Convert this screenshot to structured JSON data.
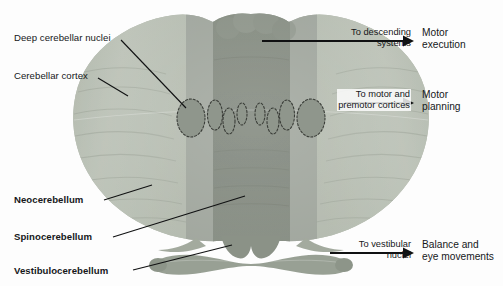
{
  "figure": {
    "background_color": "#fdfdfd",
    "width": 503,
    "height": 286
  },
  "palette": {
    "cortex_light": "#b9bfb4",
    "cortex_mid": "#a9b0a4",
    "cortex_shadow": "#949b90",
    "band_intermediate": "#9aa096",
    "band_vermis": "#7f867c",
    "nuclei_fill": "#8f968c",
    "nuclei_outline": "#3a3d38",
    "line_color": "#101112",
    "text_color": "#16181a"
  },
  "structure_labels": [
    {
      "id": "deep-cerebellar-nuclei",
      "text": "Deep cerebellar nuclei",
      "bold": false,
      "text_x": 14,
      "text_y": 32,
      "leader": {
        "x1": 121,
        "y1": 40,
        "x2": 186,
        "y2": 108
      }
    },
    {
      "id": "cerebellar-cortex",
      "text": "Cerebellar cortex",
      "bold": false,
      "text_x": 14,
      "text_y": 70,
      "leader": {
        "x1": 98,
        "y1": 78,
        "x2": 128,
        "y2": 96
      }
    },
    {
      "id": "neocerebellum",
      "text": "Neocerebellum",
      "bold": true,
      "text_x": 14,
      "text_y": 194,
      "leader": {
        "x1": 104,
        "y1": 200,
        "x2": 152,
        "y2": 185
      }
    },
    {
      "id": "spinocerebellum",
      "text": "Spinocerebellum",
      "bold": true,
      "text_x": 14,
      "text_y": 231,
      "leader": {
        "x1": 113,
        "y1": 237,
        "x2": 245,
        "y2": 196
      }
    },
    {
      "id": "vestibulocerebellum",
      "text": "Vestibulocerebellum",
      "bold": true,
      "text_x": 14,
      "text_y": 265,
      "leader": {
        "x1": 133,
        "y1": 270,
        "x2": 232,
        "y2": 245
      }
    }
  ],
  "projections": [
    {
      "id": "motor-execution",
      "target_text_line1": "To descending",
      "target_text_line2": "systems",
      "target_x_right": 411,
      "target_y": 27,
      "arrow": {
        "x1": 262,
        "y1": 41,
        "x2": 414,
        "y2": 41
      },
      "boxed": false,
      "function_line1": "Motor",
      "function_line2": "execution",
      "function_x": 422,
      "function_y": 27
    },
    {
      "id": "motor-planning",
      "target_text_line1": "To motor and",
      "target_text_line2": "premotor cortices",
      "target_x_right": 411,
      "target_y": 89,
      "arrow": {
        "x1": 345,
        "y1": 103,
        "x2": 414,
        "y2": 103
      },
      "boxed": true,
      "function_line1": "Motor",
      "function_line2": "planning",
      "function_x": 422,
      "function_y": 89
    },
    {
      "id": "balance-eye-movements",
      "target_text_line1": "To vestibular",
      "target_text_line2": "nuclei",
      "target_x_right": 411,
      "target_y": 239,
      "arrow": {
        "x1": 330,
        "y1": 253,
        "x2": 414,
        "y2": 253
      },
      "boxed": false,
      "function_line1": "Balance and",
      "function_line2": "eye movements",
      "function_x": 422,
      "function_y": 239
    }
  ],
  "anatomy": {
    "regions": [
      {
        "name": "left-hemisphere-neocerebellum",
        "shade": "#b9bfb4"
      },
      {
        "name": "right-hemisphere-neocerebellum",
        "shade": "#b9bfb4"
      },
      {
        "name": "left-intermediate-zone",
        "shade": "#9aa096"
      },
      {
        "name": "right-intermediate-zone",
        "shade": "#9aa096"
      },
      {
        "name": "vermis-band",
        "shade": "#7f867c"
      },
      {
        "name": "flocculonodular-lobe",
        "shade": "#a9b0a4"
      }
    ],
    "nuclei_groups": [
      {
        "name": "dentate-nucleus-left"
      },
      {
        "name": "emboliform-nucleus-left"
      },
      {
        "name": "globose-nucleus-left"
      },
      {
        "name": "fastigial-nucleus-left"
      },
      {
        "name": "fastigial-nucleus-right"
      },
      {
        "name": "globose-nucleus-right"
      },
      {
        "name": "emboliform-nucleus-right"
      },
      {
        "name": "dentate-nucleus-right"
      }
    ]
  }
}
